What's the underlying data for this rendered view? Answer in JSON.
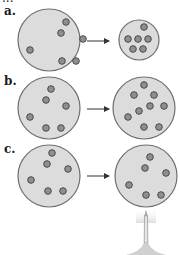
{
  "header": {
    "cut_text": "..."
  },
  "rows": [
    {
      "label": "a.",
      "description": "compressed",
      "left": {
        "cx": 49,
        "cy": 40,
        "r": 31,
        "particles": [
          [
            66,
            22
          ],
          [
            61,
            33
          ],
          [
            83,
            39
          ],
          [
            30,
            50
          ],
          [
            62,
            61
          ],
          [
            76,
            61
          ]
        ]
      },
      "arrow": {
        "x1": 87,
        "x2": 109,
        "y": 41
      },
      "right": {
        "cx": 139,
        "cy": 40,
        "r": 20,
        "particles": [
          [
            144,
            27
          ],
          [
            128,
            39
          ],
          [
            138,
            39
          ],
          [
            148,
            39
          ],
          [
            133,
            49
          ],
          [
            143,
            49
          ]
        ]
      }
    },
    {
      "label": "b.",
      "description": "particles added",
      "left": {
        "cx": 49,
        "cy": 108,
        "r": 31,
        "particles": [
          [
            51,
            89
          ],
          [
            46,
            100
          ],
          [
            66,
            106
          ],
          [
            30,
            117
          ],
          [
            46,
            128
          ],
          [
            61,
            128
          ]
        ]
      },
      "arrow": {
        "x1": 87,
        "x2": 109,
        "y": 109
      },
      "right": {
        "cx": 144,
        "cy": 108,
        "r": 31,
        "particles": [
          [
            144,
            85
          ],
          [
            134,
            95
          ],
          [
            154,
            95
          ],
          [
            150,
            106
          ],
          [
            164,
            106
          ],
          [
            139,
            111
          ],
          [
            128,
            117
          ],
          [
            144,
            127
          ],
          [
            159,
            127
          ]
        ]
      }
    },
    {
      "label": "c.",
      "description": "heated",
      "left": {
        "cx": 49,
        "cy": 176,
        "r": 31,
        "particles": [
          [
            52,
            153
          ],
          [
            47,
            164
          ],
          [
            68,
            169
          ],
          [
            31,
            180
          ],
          [
            48,
            191
          ],
          [
            63,
            191
          ]
        ]
      },
      "arrow": {
        "x1": 87,
        "x2": 109,
        "y": 176
      },
      "right": {
        "cx": 146,
        "cy": 176,
        "r": 31,
        "particles": [
          [
            150,
            157
          ],
          [
            145,
            168
          ],
          [
            166,
            173
          ],
          [
            129,
            185
          ],
          [
            146,
            195
          ],
          [
            161,
            195
          ]
        ]
      }
    }
  ],
  "burner": {
    "x": 146,
    "top": 215,
    "bottom": 255,
    "label": "flame"
  },
  "colors": {
    "circle_fill": "#dcdcdc",
    "circle_stroke": "#6e6e6e",
    "particle_fill": "#8f8f8f",
    "particle_stroke": "#4a4a4a",
    "arrow": "#333333"
  }
}
